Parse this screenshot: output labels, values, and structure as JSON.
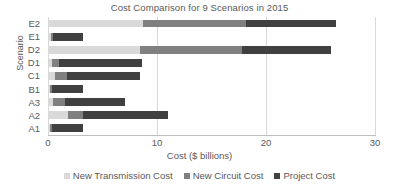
{
  "chart_data": {
    "type": "bar",
    "orientation": "horizontal",
    "stacked": true,
    "title": "Cost Comparison for 9 Scenarios in 2015",
    "xlabel": "Cost ($ billions)",
    "ylabel": "Scenario",
    "xlim": [
      0,
      30
    ],
    "xticks": [
      0,
      10,
      20,
      30
    ],
    "xtick_labels": [
      "0",
      "10",
      "20",
      "30"
    ],
    "grid": "vertical",
    "legend_position": "bottom",
    "categories": [
      "E2",
      "E1",
      "D2",
      "D1",
      "C1",
      "B1",
      "A3",
      "A2",
      "A1"
    ],
    "series": [
      {
        "name": "New Transmission Cost",
        "color": "#d9d9d9",
        "values": [
          8.7,
          0.3,
          8.4,
          0.4,
          0.6,
          0.2,
          0.5,
          1.8,
          0.2
        ]
      },
      {
        "name": "New Circuit Cost",
        "color": "#808080",
        "values": [
          9.5,
          0.2,
          9.4,
          0.6,
          1.1,
          0.2,
          1.1,
          1.4,
          0.2
        ]
      },
      {
        "name": "Project Cost",
        "color": "#404040",
        "values": [
          8.2,
          2.7,
          8.2,
          7.6,
          6.7,
          2.8,
          5.5,
          7.8,
          2.8
        ]
      }
    ],
    "totals": [
      26.4,
      3.2,
      26.0,
      8.6,
      8.4,
      3.2,
      7.1,
      11.0,
      3.2
    ]
  },
  "legend": {
    "items": [
      {
        "label": "New Transmission Cost",
        "color": "#d9d9d9"
      },
      {
        "label": "New Circuit Cost",
        "color": "#808080"
      },
      {
        "label": "Project Cost",
        "color": "#404040"
      }
    ]
  }
}
